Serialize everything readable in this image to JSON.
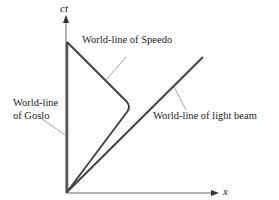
{
  "diagram": {
    "axes": {
      "vertical_label": "ct",
      "horizontal_label": "x"
    },
    "labels": {
      "speedo": "World-line of Speedo",
      "goslo_line1": "World-line",
      "goslo_line2": "of Goslo",
      "light_beam": "World-line of light beam"
    },
    "colors": {
      "line": "#444444",
      "axis": "#555555",
      "text": "#222222",
      "background": "#ffffff"
    }
  }
}
